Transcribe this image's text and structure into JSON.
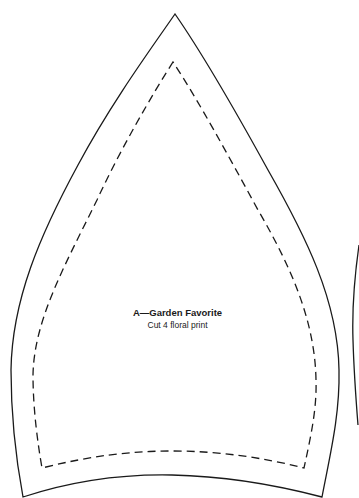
{
  "pattern": {
    "piece": {
      "title": "A—Garden Favorite",
      "instruction": "Cut 4 floral print"
    },
    "lines": {
      "cutting_line": "solid",
      "seam_line": "dashed"
    },
    "colors": {
      "background": "#ffffff",
      "line": "#1a1a1a"
    }
  }
}
